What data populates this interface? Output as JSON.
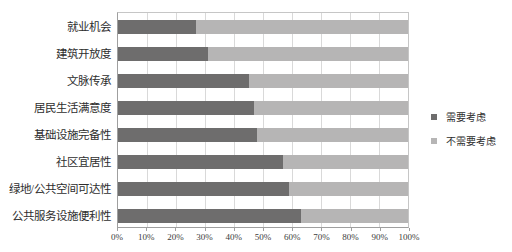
{
  "chart_data": {
    "type": "bar",
    "orientation": "horizontal",
    "stacked": true,
    "title": "",
    "xlabel": "",
    "ylabel": "",
    "categories": [
      "就业机会",
      "建筑开放度",
      "文脉传承",
      "居民生活满意度",
      "基础设施完备性",
      "社区宜居性",
      "绿地/公共空间可达性",
      "公共服务设施便利性"
    ],
    "series": [
      {
        "name": "需要考虑",
        "color": "#6e6d6d",
        "values": [
          27,
          31,
          45,
          47,
          48,
          57,
          59,
          63
        ]
      },
      {
        "name": "不需要考虑",
        "color": "#b6b5b5",
        "values": [
          73,
          69,
          55,
          53,
          52,
          43,
          41,
          37
        ]
      }
    ],
    "x_ticks": [
      "0%",
      "10%",
      "20%",
      "30%",
      "40%",
      "50%",
      "60%",
      "70%",
      "80%",
      "90%",
      "100%"
    ],
    "xlim": [
      0,
      100
    ],
    "grid": true,
    "gridline_color": "#d9d9d9",
    "legend_position": "right"
  }
}
